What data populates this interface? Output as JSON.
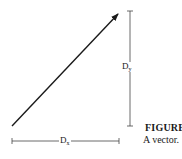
{
  "diagram": {
    "type": "vector-components",
    "vector": {
      "from": [
        12,
        126
      ],
      "to": [
        119,
        13
      ],
      "label": ""
    },
    "vertical_dimension": {
      "label_main": "D",
      "label_sub": "y",
      "x": 130,
      "y1": 11,
      "y2": 126
    },
    "horizontal_dimension": {
      "label_main": "D",
      "label_sub": "x",
      "y": 141,
      "x1": 12,
      "x2": 119
    }
  },
  "caption": {
    "title": "FIGURE",
    "text": "A vector."
  },
  "colors": {
    "ink": "#1a1a1a",
    "background": "#ffffff"
  }
}
